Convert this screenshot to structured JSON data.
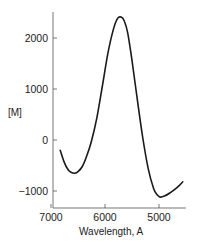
{
  "chart_data": {
    "type": "line",
    "title": "",
    "xlabel": "Wavelength, A",
    "ylabel": "[M]",
    "xlim": [
      7000,
      4500
    ],
    "ylim": [
      -1250,
      2600
    ],
    "x_ticks": [
      7000,
      6000,
      5000
    ],
    "y_ticks": [
      2000,
      1000,
      0,
      -1000
    ],
    "x_tick_labels": [
      "7000",
      "6000",
      "5000"
    ],
    "y_tick_labels": [
      "2000",
      "1000",
      "0",
      "−1000"
    ],
    "grid": false,
    "legend": null,
    "x_reversed": true,
    "series": [
      {
        "name": "[M]",
        "x": [
          6830,
          6750,
          6680,
          6620,
          6560,
          6500,
          6420,
          6340,
          6250,
          6150,
          6050,
          5950,
          5850,
          5770,
          5700,
          5640,
          5580,
          5500,
          5400,
          5300,
          5200,
          5100,
          5030,
          4980,
          4900,
          4800,
          4700,
          4620,
          4560
        ],
        "values": [
          -200,
          -450,
          -590,
          -640,
          -650,
          -620,
          -520,
          -320,
          -20,
          440,
          1050,
          1680,
          2150,
          2380,
          2410,
          2330,
          2100,
          1560,
          780,
          40,
          -560,
          -950,
          -1080,
          -1120,
          -1100,
          -1040,
          -960,
          -890,
          -820
        ]
      }
    ]
  },
  "labels": {
    "ylabel": "[M]",
    "xlabel": "Wavelength, A",
    "yticks": [
      "2000",
      "1000",
      "0",
      "−1000"
    ],
    "xticks": [
      "7000",
      "6000",
      "5000"
    ]
  }
}
